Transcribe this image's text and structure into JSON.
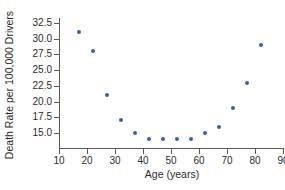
{
  "chart_data": {
    "type": "scatter",
    "title": "",
    "xlabel": "Age (years)",
    "ylabel": "Death Rate per 100,000 Drivers",
    "xlim": [
      10,
      90
    ],
    "ylim": [
      13.2,
      33.4
    ],
    "xticks": [
      10,
      20,
      30,
      40,
      50,
      60,
      70,
      80,
      90
    ],
    "xticklabels": [
      "10",
      "20",
      "30",
      "40",
      "50",
      "60",
      "70",
      "80",
      "90"
    ],
    "yticks": [
      15.0,
      17.5,
      20.0,
      22.5,
      25.0,
      27.5,
      30.0,
      32.5
    ],
    "yticklabels": [
      "15.0",
      "17.5",
      "20.0",
      "22.5",
      "25.0",
      "27.5",
      "30.0",
      "32.5"
    ],
    "grid": false,
    "legend": null,
    "marker_color": "#3a5fa8",
    "axis_color": "#5a5a5a",
    "background_color": "#ffffff",
    "x": [
      17,
      22,
      27,
      32,
      37,
      42,
      47,
      52,
      57,
      62,
      67,
      72,
      77,
      82
    ],
    "y": [
      31,
      28,
      21,
      17,
      15,
      14,
      14,
      14,
      14,
      15,
      16,
      19,
      23,
      29
    ],
    "points": [
      {
        "x": 17,
        "y": 31
      },
      {
        "x": 22,
        "y": 28
      },
      {
        "x": 27,
        "y": 21
      },
      {
        "x": 32,
        "y": 17
      },
      {
        "x": 37,
        "y": 15
      },
      {
        "x": 42,
        "y": 14
      },
      {
        "x": 47,
        "y": 14
      },
      {
        "x": 52,
        "y": 14
      },
      {
        "x": 57,
        "y": 14
      },
      {
        "x": 62,
        "y": 15
      },
      {
        "x": 67,
        "y": 16
      },
      {
        "x": 72,
        "y": 19
      },
      {
        "x": 77,
        "y": 23
      },
      {
        "x": 82,
        "y": 29
      }
    ]
  }
}
